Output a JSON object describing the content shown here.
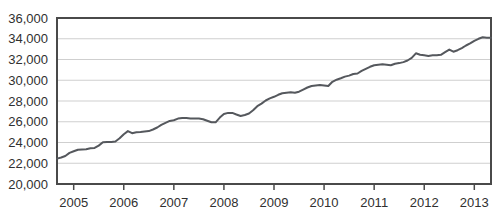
{
  "figure": {
    "background": "#ffffff",
    "plot_border_color": "#4a4a4a",
    "gridline_color": "#cfcfcf",
    "line_color": "#55585d",
    "label_color": "#303030"
  },
  "chart_data": {
    "type": "line",
    "title": "",
    "xlabel": "",
    "ylabel": "",
    "legend": "none",
    "grid": "horizontal",
    "ylim": [
      20000,
      36000
    ],
    "y_tick_step": 2000,
    "y_tick_labels": [
      "20,000",
      "22,000",
      "24,000",
      "26,000",
      "28,000",
      "30,000",
      "32,000",
      "34,000",
      "36,000"
    ],
    "x_tick_labels": [
      "2005",
      "2006",
      "2007",
      "2008",
      "2009",
      "2010",
      "2011",
      "2012",
      "2013"
    ],
    "series": [
      {
        "name": "monthly-value",
        "frequency": "monthly",
        "start_year": 2004,
        "start_month": 9,
        "values": [
          22450,
          22550,
          22700,
          23000,
          23150,
          23300,
          23330,
          23350,
          23450,
          23480,
          23700,
          24030,
          24050,
          24050,
          24100,
          24400,
          24800,
          25100,
          24900,
          24980,
          25000,
          25050,
          25100,
          25250,
          25450,
          25700,
          25900,
          26080,
          26150,
          26300,
          26350,
          26350,
          26300,
          26300,
          26300,
          26250,
          26100,
          25950,
          25950,
          26400,
          26750,
          26850,
          26850,
          26700,
          26550,
          26650,
          26800,
          27100,
          27500,
          27750,
          28050,
          28250,
          28400,
          28600,
          28750,
          28800,
          28850,
          28800,
          28900,
          29100,
          29300,
          29450,
          29500,
          29550,
          29500,
          29450,
          29850,
          30050,
          30200,
          30350,
          30450,
          30600,
          30650,
          30900,
          31100,
          31300,
          31450,
          31500,
          31550,
          31500,
          31450,
          31600,
          31650,
          31750,
          31900,
          32150,
          32600,
          32450,
          32400,
          32350,
          32400,
          32400,
          32450,
          32700,
          32950,
          32750,
          32900,
          33100,
          33350,
          33550,
          33800,
          34000,
          34150,
          34100,
          34100
        ]
      }
    ]
  }
}
